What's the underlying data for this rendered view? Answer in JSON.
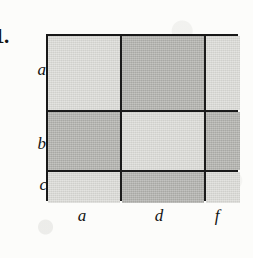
{
  "figure": {
    "problem_number": "1.",
    "type": "shaded-grid-matrix",
    "row_labels": [
      "a",
      "b",
      "c"
    ],
    "col_labels": [
      "a",
      "d",
      "f"
    ],
    "colors": {
      "light": "#dedeDA",
      "dark": "#b4b4b0",
      "border": "#181818",
      "background": "#fcfcfa"
    },
    "cells": [
      {
        "row": "a",
        "col": "a",
        "shade": "light"
      },
      {
        "row": "a",
        "col": "d",
        "shade": "dark"
      },
      {
        "row": "a",
        "col": "f",
        "shade": "light"
      },
      {
        "row": "b",
        "col": "a",
        "shade": "dark"
      },
      {
        "row": "b",
        "col": "d",
        "shade": "light"
      },
      {
        "row": "b",
        "col": "f",
        "shade": "dark"
      },
      {
        "row": "c",
        "col": "a",
        "shade": "light"
      },
      {
        "row": "c",
        "col": "d",
        "shade": "dark"
      },
      {
        "row": "c",
        "col": "f",
        "shade": "light"
      }
    ]
  }
}
